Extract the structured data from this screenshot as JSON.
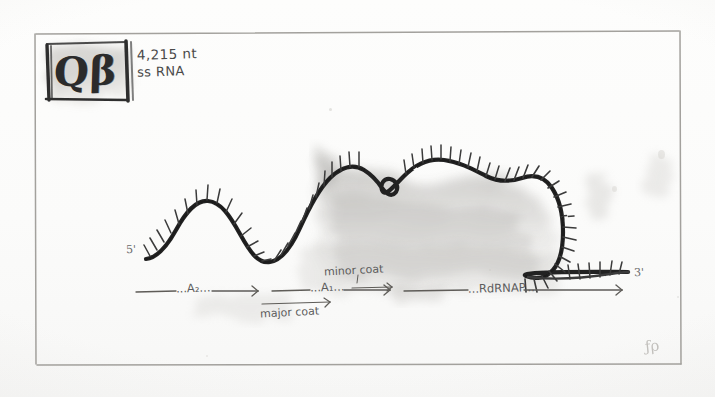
{
  "figure": {
    "kind": "hand-drawn-sketch",
    "background_color": "#fdfdfc",
    "ink_color": "#2b2b2b",
    "pencil_color": "#8d8b87"
  },
  "title_block": {
    "logo_text": "Qβ",
    "length_label": "4,215 nt",
    "genome_type_label": "ss RNA"
  },
  "strand": {
    "five_prime_label": "5'",
    "three_prime_label": "3'",
    "description": "single-stranded RNA drawn as a thick undulating ink curve with radiating tick marks"
  },
  "gene_map": {
    "genes": [
      {
        "label": "...A₂...",
        "frame": "main"
      },
      {
        "label": "...A₁...",
        "frame": "main"
      },
      {
        "label": "...RdRNAP...",
        "frame": "main"
      },
      {
        "label": "major coat",
        "frame": "overlapping-below"
      },
      {
        "label": "minor coat",
        "frame": "overlapping-above"
      }
    ]
  },
  "signature": {
    "monogram": "ƒρ"
  }
}
